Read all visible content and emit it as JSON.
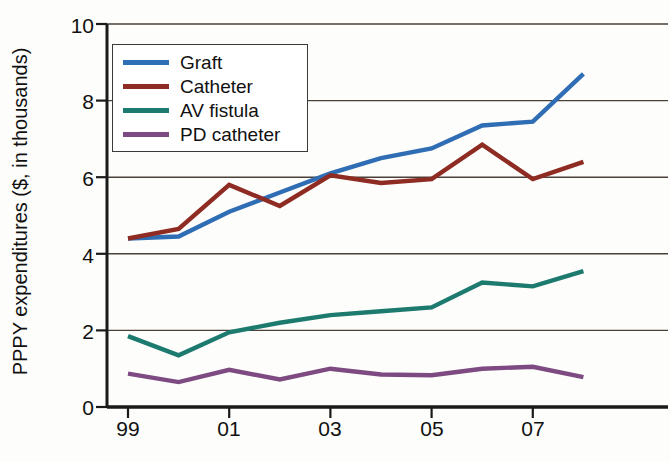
{
  "chart_data": {
    "type": "line",
    "title": "",
    "xlabel": "",
    "ylabel": "PPPY expenditures ($, in thousands)",
    "x": [
      1999,
      2000,
      2001,
      2002,
      2003,
      2004,
      2005,
      2006,
      2007,
      2008
    ],
    "x_tick_values": [
      1999,
      2001,
      2003,
      2005,
      2007
    ],
    "x_tick_labels": [
      "99",
      "01",
      "03",
      "05",
      "07"
    ],
    "y_tick_values": [
      0,
      2,
      4,
      6,
      8,
      10
    ],
    "y_tick_labels": [
      "0",
      "2",
      "4",
      "6",
      "8",
      "10"
    ],
    "xlim": [
      1998.6,
      2008.6
    ],
    "ylim": [
      0,
      10
    ],
    "grid": "horizontal",
    "legend_position": "upper-left-inside",
    "series": [
      {
        "name": "Graft",
        "color": "#2f6db4",
        "values": [
          4.4,
          4.45,
          5.1,
          5.6,
          6.1,
          6.5,
          6.75,
          7.35,
          7.45,
          8.7
        ]
      },
      {
        "name": "Catheter",
        "color": "#8e2b22",
        "values": [
          4.4,
          4.65,
          5.8,
          5.25,
          6.05,
          5.85,
          5.95,
          6.85,
          5.95,
          6.4
        ]
      },
      {
        "name": "AV fistula",
        "color": "#1c7a6e",
        "values": [
          1.85,
          1.35,
          1.95,
          2.2,
          2.4,
          2.5,
          2.6,
          3.25,
          3.15,
          3.55
        ]
      },
      {
        "name": "PD catheter",
        "color": "#7d4a82",
        "values": [
          0.87,
          0.65,
          0.97,
          0.72,
          1.0,
          0.85,
          0.83,
          1.0,
          1.05,
          0.78
        ]
      }
    ]
  },
  "axis": {
    "y_label": "PPPY expenditures ($, in thousands)",
    "y_ticks": [
      "10",
      "8",
      "6",
      "4",
      "2",
      "0"
    ],
    "x_ticks": [
      "99",
      "01",
      "03",
      "05",
      "07"
    ]
  },
  "legend": {
    "items": [
      {
        "label": "Graft",
        "color": "#2f6db4"
      },
      {
        "label": "Catheter",
        "color": "#8e2b22"
      },
      {
        "label": "AV fistula",
        "color": "#1c7a6e"
      },
      {
        "label": "PD catheter",
        "color": "#7d4a82"
      }
    ]
  },
  "colors": {
    "axis": "#1a1a1a",
    "grid": "#4a4038",
    "background": "#fdfdfb",
    "text": "#111111"
  }
}
